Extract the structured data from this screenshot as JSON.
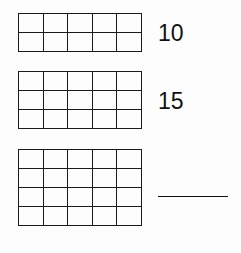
{
  "problems": [
    {
      "rows": 2,
      "cols": 5,
      "answer": "10"
    },
    {
      "rows": 3,
      "cols": 5,
      "answer": "15"
    },
    {
      "rows": 4,
      "cols": 5,
      "answer": ""
    }
  ]
}
